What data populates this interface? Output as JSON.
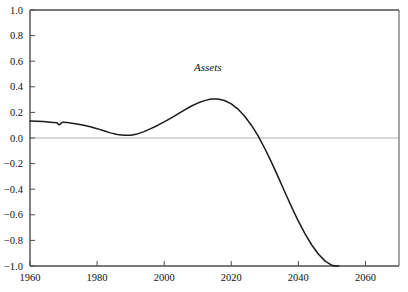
{
  "chart_data": {
    "type": "line",
    "title": "",
    "subtitle": "",
    "xlabel": "",
    "ylabel": "",
    "xlim": [
      1960,
      2070
    ],
    "ylim": [
      -1.0,
      1.0
    ],
    "grid": false,
    "zero_line": true,
    "legend_position": "inline-annotation",
    "annotations": [
      {
        "text": "Assets",
        "x": 2013,
        "y": 0.52,
        "style": "italic"
      }
    ],
    "x_ticks": [
      1960,
      1980,
      2000,
      2020,
      2040,
      2060
    ],
    "x_tick_labels": [
      "1960",
      "1980",
      "2000",
      "2020",
      "2040",
      "2060"
    ],
    "y_ticks": [
      -1.0,
      -0.8,
      -0.6,
      -0.4,
      -0.2,
      0.0,
      0.2,
      0.4,
      0.6,
      0.8,
      1.0
    ],
    "y_tick_labels": [
      "−1.0",
      "−0.8",
      "−0.6",
      "−0.4",
      "−0.2",
      "0.0",
      "0.2",
      "0.4",
      "0.6",
      "0.8",
      "1.0"
    ],
    "series": [
      {
        "name": "Assets",
        "color": "#1a1a1a",
        "x": [
          1960,
          1962,
          1964,
          1966,
          1967,
          1968,
          1968.6,
          1969,
          1969.6,
          1970,
          1971,
          1972,
          1974,
          1976,
          1978,
          1980,
          1982,
          1984,
          1986,
          1988,
          1990,
          1992,
          1994,
          1996,
          1998,
          2000,
          2002,
          2004,
          2006,
          2008,
          2010,
          2012,
          2014,
          2016,
          2018,
          2020,
          2022,
          2024,
          2026,
          2028,
          2030,
          2032,
          2034,
          2036,
          2038,
          2040,
          2042,
          2044,
          2046,
          2048,
          2050,
          2051,
          2052
        ],
        "y": [
          0.133,
          0.131,
          0.128,
          0.124,
          0.122,
          0.12,
          0.104,
          0.107,
          0.122,
          0.124,
          0.122,
          0.118,
          0.11,
          0.1,
          0.088,
          0.073,
          0.056,
          0.04,
          0.028,
          0.021,
          0.022,
          0.032,
          0.05,
          0.073,
          0.098,
          0.126,
          0.156,
          0.187,
          0.218,
          0.248,
          0.273,
          0.292,
          0.304,
          0.305,
          0.293,
          0.267,
          0.226,
          0.17,
          0.1,
          0.016,
          -0.082,
          -0.19,
          -0.306,
          -0.424,
          -0.54,
          -0.65,
          -0.749,
          -0.836,
          -0.908,
          -0.962,
          -0.995,
          -1.0,
          -1.0
        ]
      }
    ],
    "colors": {
      "line": "#1a1a1a",
      "axis": "#4d4d4d",
      "zero_line": "#b3b3b3",
      "text": "#111111",
      "background": "#ffffff"
    }
  },
  "axes": {
    "frame": {
      "left_px": 30,
      "right_px": 399,
      "top_px": 10,
      "bottom_px": 266
    }
  }
}
